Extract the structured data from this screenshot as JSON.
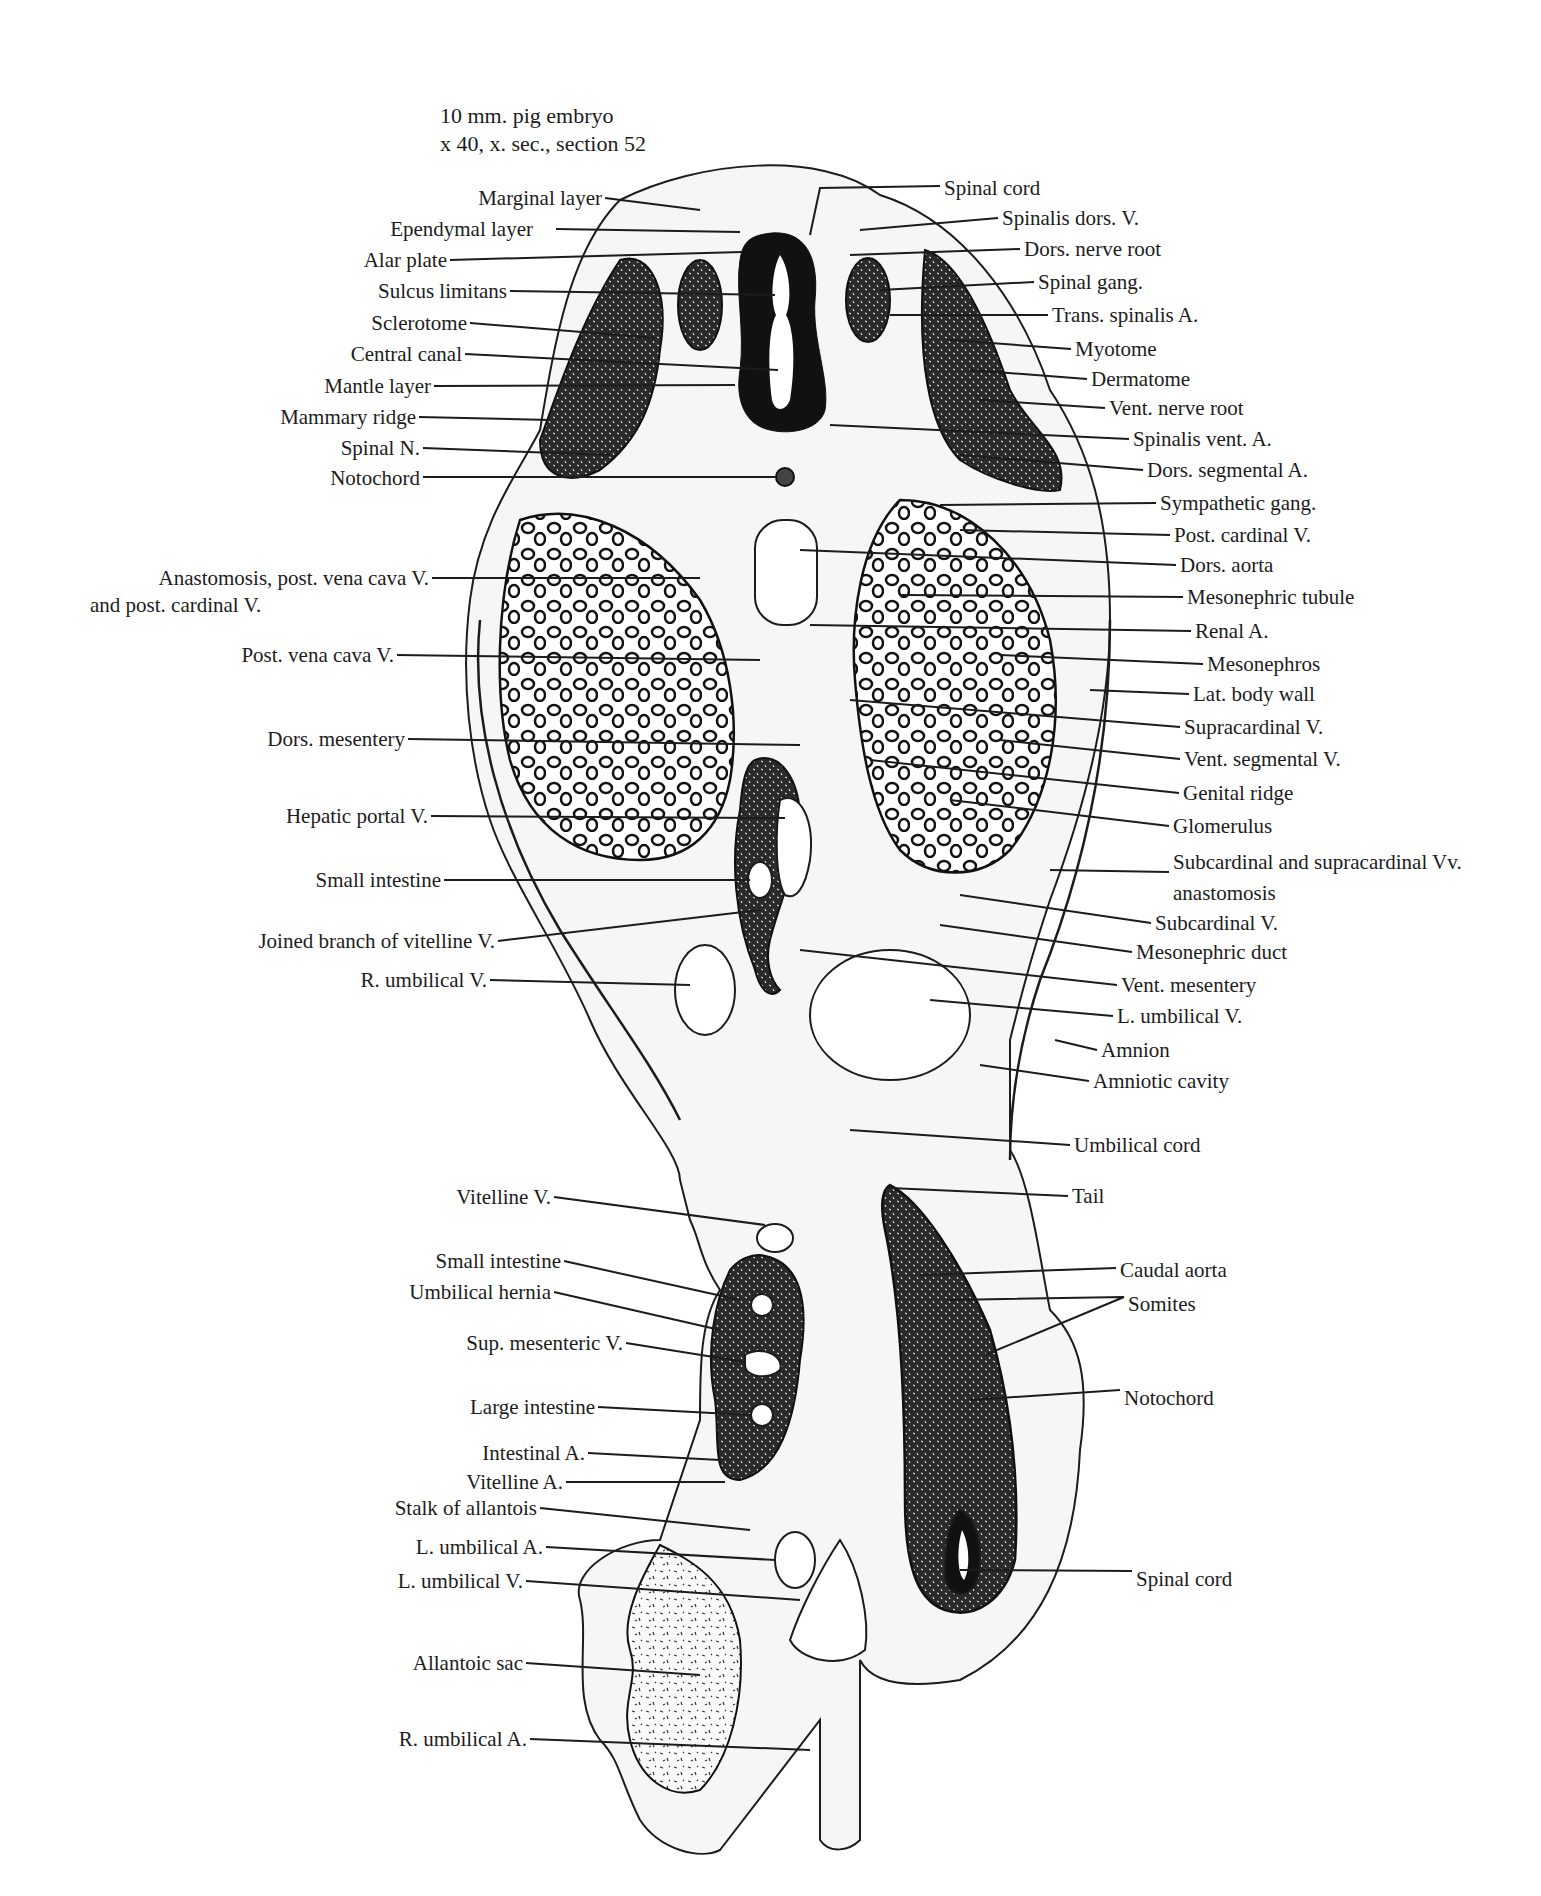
{
  "figure": {
    "title_line1": "10 mm. pig embryo",
    "title_line2": "x 40, x. sec., section 52"
  },
  "labels_left": [
    {
      "text": "Marginal layer",
      "x": 602,
      "y": 186
    },
    {
      "text": "Ependymal layer",
      "x": 533,
      "y": 217
    },
    {
      "text": "Alar plate",
      "x": 447,
      "y": 248
    },
    {
      "text": "Sulcus limitans",
      "x": 507,
      "y": 279
    },
    {
      "text": "Sclerotome",
      "x": 467,
      "y": 311
    },
    {
      "text": "Central canal",
      "x": 462,
      "y": 342
    },
    {
      "text": "Mantle layer",
      "x": 431,
      "y": 374
    },
    {
      "text": "Mammary ridge",
      "x": 416,
      "y": 405
    },
    {
      "text": "Spinal N.",
      "x": 420,
      "y": 436
    },
    {
      "text": "Notochord",
      "x": 420,
      "y": 466
    },
    {
      "text": "Anastomosis, post. vena cava V.",
      "x": 429,
      "y": 566
    },
    {
      "text": "and post. cardinal V.",
      "x": 90,
      "y": 593,
      "align": "left"
    },
    {
      "text": "Post. vena cava V.",
      "x": 394,
      "y": 643
    },
    {
      "text": "Dors. mesentery",
      "x": 405,
      "y": 727
    },
    {
      "text": "Hepatic portal V.",
      "x": 428,
      "y": 804
    },
    {
      "text": "Small intestine",
      "x": 441,
      "y": 868
    },
    {
      "text": "Joined branch of vitelline V.",
      "x": 495,
      "y": 929
    },
    {
      "text": "R. umbilical V.",
      "x": 487,
      "y": 968
    },
    {
      "text": "Vitelline V.",
      "x": 551,
      "y": 1185
    },
    {
      "text": "Small intestine",
      "x": 561,
      "y": 1249
    },
    {
      "text": "Umbilical hernia",
      "x": 551,
      "y": 1280
    },
    {
      "text": "Sup. mesenteric V.",
      "x": 623,
      "y": 1331
    },
    {
      "text": "Large intestine",
      "x": 595,
      "y": 1395
    },
    {
      "text": "Intestinal A.",
      "x": 585,
      "y": 1441
    },
    {
      "text": "Vitelline A.",
      "x": 563,
      "y": 1470
    },
    {
      "text": "Stalk of allantois",
      "x": 537,
      "y": 1496
    },
    {
      "text": "L. umbilical A.",
      "x": 543,
      "y": 1535
    },
    {
      "text": "L. umbilical V.",
      "x": 523,
      "y": 1569
    },
    {
      "text": "Allantoic sac",
      "x": 523,
      "y": 1651
    },
    {
      "text": "R. umbilical A.",
      "x": 527,
      "y": 1727
    }
  ],
  "labels_right": [
    {
      "text": "Spinal cord",
      "x": 944,
      "y": 176
    },
    {
      "text": "Spinalis dors. V.",
      "x": 1002,
      "y": 206
    },
    {
      "text": "Dors. nerve root",
      "x": 1024,
      "y": 237
    },
    {
      "text": "Spinal gang.",
      "x": 1038,
      "y": 270
    },
    {
      "text": "Trans. spinalis A.",
      "x": 1052,
      "y": 303
    },
    {
      "text": "Myotome",
      "x": 1075,
      "y": 337
    },
    {
      "text": "Dermatome",
      "x": 1091,
      "y": 367
    },
    {
      "text": "Vent. nerve root",
      "x": 1109,
      "y": 396
    },
    {
      "text": "Spinalis vent. A.",
      "x": 1133,
      "y": 427
    },
    {
      "text": "Dors. segmental A.",
      "x": 1147,
      "y": 458
    },
    {
      "text": "Sympathetic gang.",
      "x": 1160,
      "y": 491
    },
    {
      "text": "Post. cardinal V.",
      "x": 1174,
      "y": 523
    },
    {
      "text": "Dors. aorta",
      "x": 1180,
      "y": 553
    },
    {
      "text": "Mesonephric tubule",
      "x": 1187,
      "y": 585
    },
    {
      "text": "Renal A.",
      "x": 1195,
      "y": 619
    },
    {
      "text": "Mesonephros",
      "x": 1207,
      "y": 652
    },
    {
      "text": "Lat. body wall",
      "x": 1193,
      "y": 682
    },
    {
      "text": "Supracardinal V.",
      "x": 1184,
      "y": 715
    },
    {
      "text": "Vent. segmental V.",
      "x": 1184,
      "y": 747
    },
    {
      "text": "Genital ridge",
      "x": 1183,
      "y": 781
    },
    {
      "text": "Glomerulus",
      "x": 1173,
      "y": 814
    },
    {
      "text": "Subcardinal and supracardinal Vv.",
      "x": 1173,
      "y": 850
    },
    {
      "text": "anastomosis",
      "x": 1173,
      "y": 881
    },
    {
      "text": "Subcardinal V.",
      "x": 1155,
      "y": 911
    },
    {
      "text": "Mesonephric duct",
      "x": 1136,
      "y": 940
    },
    {
      "text": "Vent. mesentery",
      "x": 1121,
      "y": 973
    },
    {
      "text": "L. umbilical V.",
      "x": 1117,
      "y": 1004
    },
    {
      "text": "Amnion",
      "x": 1101,
      "y": 1038
    },
    {
      "text": "Amniotic cavity",
      "x": 1093,
      "y": 1069
    },
    {
      "text": "Umbilical cord",
      "x": 1074,
      "y": 1133
    },
    {
      "text": "Tail",
      "x": 1072,
      "y": 1184
    },
    {
      "text": "Caudal aorta",
      "x": 1120,
      "y": 1258
    },
    {
      "text": "Somites",
      "x": 1128,
      "y": 1292
    },
    {
      "text": "Notochord",
      "x": 1124,
      "y": 1386
    },
    {
      "text": "Spinal cord",
      "x": 1136,
      "y": 1567
    }
  ]
}
